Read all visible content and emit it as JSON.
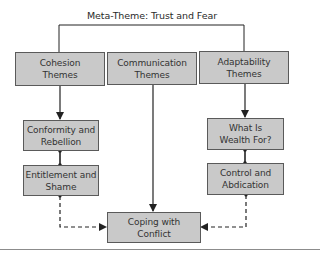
{
  "diagram": {
    "title": "Meta-Theme: Trust and Fear",
    "colors": {
      "box_fill": "#c9c9c9",
      "box_border": "#5a5a5a",
      "line": "#222222",
      "text": "#333333"
    },
    "nodes": {
      "cohesion": {
        "label": "Cohesion\nThemes"
      },
      "communication": {
        "label": "Communication\nThemes"
      },
      "adaptability": {
        "label": "Adaptability\nThemes"
      },
      "conformity": {
        "label": "Conformity and\nRebellion"
      },
      "entitlement": {
        "label": "Entitlement and\nShame"
      },
      "wealth": {
        "label": "What Is\nWealth For?"
      },
      "control": {
        "label": "Control and\nAbdication"
      },
      "coping": {
        "label": "Coping with\nConflict"
      }
    },
    "edges": [
      {
        "from": "meta-theme",
        "to": "cohesion",
        "style": "solid-bracket"
      },
      {
        "from": "meta-theme",
        "to": "adaptability",
        "style": "solid-bracket"
      },
      {
        "from": "cohesion",
        "to": "conformity",
        "style": "solid-arrow"
      },
      {
        "from": "conformity",
        "to": "entitlement",
        "style": "solid-dot"
      },
      {
        "from": "communication",
        "to": "coping",
        "style": "solid-arrow"
      },
      {
        "from": "adaptability",
        "to": "wealth",
        "style": "solid-arrow"
      },
      {
        "from": "wealth",
        "to": "control",
        "style": "solid-dot"
      },
      {
        "from": "entitlement",
        "to": "coping",
        "style": "dashed-arrow"
      },
      {
        "from": "control",
        "to": "coping",
        "style": "dashed-arrow"
      }
    ]
  }
}
